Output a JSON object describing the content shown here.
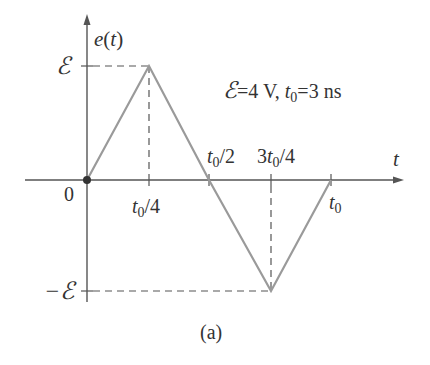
{
  "diagram": {
    "y_axis_label": "e(t)",
    "x_axis_label": "t",
    "origin_label": "0",
    "y_ticks": {
      "positive": "ℰ",
      "negative": "−ℰ"
    },
    "x_ticks": [
      {
        "label_main": "t",
        "label_sub": "0",
        "label_tail": "/4",
        "position": "t0/4"
      },
      {
        "label_main": "t",
        "label_sub": "0",
        "label_tail": "/2",
        "position": "t0/2"
      },
      {
        "label_head": "3",
        "label_main": "t",
        "label_sub": "0",
        "label_tail": "/4",
        "position": "3t0/4"
      },
      {
        "label_main": "t",
        "label_sub": "0",
        "label_tail": "",
        "position": "t0"
      }
    ],
    "parameters": {
      "emf_symbol": "ℰ",
      "emf_value": "=4 V",
      "sep": ",",
      "t0_main": "t",
      "t0_sub": "0",
      "t0_value": "=3 ns"
    },
    "caption": "(a)",
    "waveform": {
      "type": "triangle",
      "points": [
        {
          "t": "0",
          "e": "0"
        },
        {
          "t": "t0/4",
          "e": "E"
        },
        {
          "t": "t0/2",
          "e": "0"
        },
        {
          "t": "3t0/4",
          "e": "-E"
        },
        {
          "t": "t0",
          "e": "0"
        }
      ],
      "color": "#9a9a9a"
    },
    "axis_color": "#555555"
  }
}
